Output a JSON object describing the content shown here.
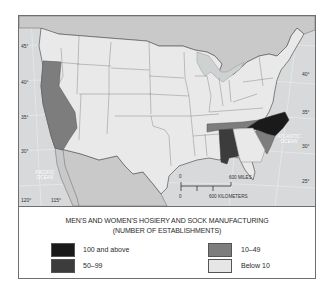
{
  "map": {
    "title_line1": "MEN'S AND WOMEN'S HOSIERY AND SOCK MANUFACTURING",
    "title_line2": "(NUMBER OF ESTABLISHMENTS)",
    "latitude_labels_left": [
      "45°",
      "40°",
      "35°",
      "30°"
    ],
    "latitude_labels_right": [
      "40°",
      "35°",
      "30°",
      "25°"
    ],
    "longitude_labels": [
      "120°",
      "115°"
    ],
    "ocean_labels": {
      "pacific": "PACIFIC OCEAN",
      "pacific_line1": "PACIFIC",
      "pacific_line2": "OCEAN",
      "atlantic": "ATLANTIC OCEAN",
      "atlantic_line1": "ATLANTIC",
      "atlantic_line2": "OCEAN"
    },
    "scale_bar": {
      "zero_top": "0",
      "zero_bottom": "0",
      "miles": "600 MILES",
      "kilometers": "600 KILOMETERS"
    },
    "highlighted_states": [
      {
        "state": "North Carolina",
        "category": "100 and above"
      },
      {
        "state": "Alabama",
        "category": "50-99"
      },
      {
        "state": "Tennessee",
        "category": "10-49"
      },
      {
        "state": "South Carolina",
        "category": "10-49"
      },
      {
        "state": "California",
        "category": "10-49"
      }
    ]
  },
  "legend": {
    "items": [
      {
        "label": "100 and above",
        "color": "#1a1a1a"
      },
      {
        "label": "50–99",
        "color": "#3c3c3c"
      },
      {
        "label": "10–49",
        "color": "#7d7d7d"
      },
      {
        "label": "Below 10",
        "color": "#e6e6e6"
      }
    ]
  },
  "colors": {
    "land_us": "#e9e9e9",
    "land_foreign": "#c9c9c9",
    "water": "#d7d9da",
    "borders": "#8a8a8a",
    "intl_border": "#2f2f2f"
  }
}
